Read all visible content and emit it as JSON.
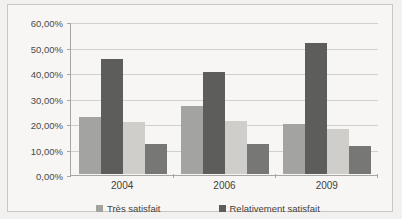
{
  "chart_data": {
    "type": "bar",
    "title": "",
    "subtitle": "",
    "xlabel": "",
    "ylabel": "",
    "categories": [
      "2004",
      "2006",
      "2009"
    ],
    "ylim": [
      0,
      60
    ],
    "ytick_labels": [
      "60,00%",
      "50,00%",
      "40,00%",
      "30,00%",
      "20,00%",
      "10,00%",
      "0,00%"
    ],
    "ytick_values": [
      60,
      50,
      40,
      30,
      20,
      10,
      0
    ],
    "grid": true,
    "legend_position": "bottom",
    "series": [
      {
        "name": "Très satisfait",
        "color": "#a3a3a1",
        "values": [
          22.5,
          26.5,
          19.8
        ],
        "labels": [
          "22,50%",
          "26,50%",
          "19,80%"
        ]
      },
      {
        "name": "Relativement satisfait",
        "color": "#5d5d5c",
        "values": [
          45.0,
          40.0,
          51.2
        ],
        "labels": [
          "45,00%",
          "40,00%",
          "51,20%"
        ]
      },
      {
        "name": "",
        "color": "#cfcecb",
        "values": [
          20.3,
          20.8,
          17.6
        ],
        "labels": [
          "20,30%",
          "20,80%",
          "17,60%"
        ]
      },
      {
        "name": "",
        "color": "#777776",
        "values": [
          11.6,
          11.9,
          10.8
        ],
        "labels": [
          "11,60%",
          "11,90%",
          "10,80%"
        ]
      }
    ]
  },
  "legend": {
    "items": [
      {
        "label": "Très satisfait",
        "color": "#a3a3a1"
      },
      {
        "label": "Relativement satisfait",
        "color": "#5d5d5c"
      }
    ]
  },
  "axis": {
    "y_max_label": "60,00%",
    "y_zero_label": "0,00%"
  }
}
